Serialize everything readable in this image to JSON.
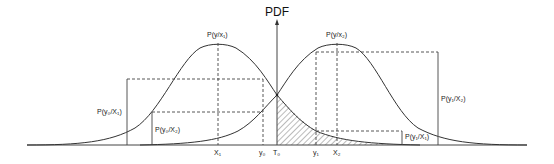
{
  "diagram": {
    "axis_label": "PDF",
    "curve_labels": {
      "left_peak": "P(y/x₁)",
      "right_peak": "P(y/x₂)"
    },
    "measure_labels": {
      "p_y0_x1": "P(y₀/X₁)",
      "p_y0_x2": "P(y₀/X₂)",
      "p_y1_x2": "P(y₁/X₂)",
      "p_y1_x1": "P(y₁/X₁)"
    },
    "x_ticks": {
      "x1": "X₁",
      "y0": "y₀",
      "t0": "T₀",
      "y1": "y₁",
      "x2": "X₂"
    },
    "colors": {
      "line": "#333333",
      "hatch": "#555555",
      "background": "#ffffff"
    }
  }
}
